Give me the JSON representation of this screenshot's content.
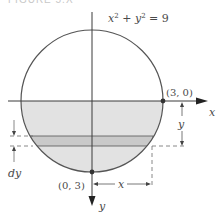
{
  "caption": "FIGURE 5.X",
  "equation": "x² + y² = 9",
  "axes": {
    "x_label": "x",
    "y_label": "y",
    "x_direction": "right",
    "y_direction": "down"
  },
  "points": [
    {
      "label": "(3, 0)",
      "name": "point-3-0"
    },
    {
      "label": "(0, 3)",
      "name": "point-0-3"
    }
  ],
  "dimensions": {
    "strip_thickness": "dy",
    "depth": "y",
    "half_width": "x"
  },
  "colors": {
    "circle_stroke": "#555555",
    "lower_fill": "#e2e2e2",
    "strip_fill": "#c9c9c9",
    "axis": "#3a3a3a",
    "dashed": "#6a6a6a",
    "text": "#4a4a4a"
  }
}
